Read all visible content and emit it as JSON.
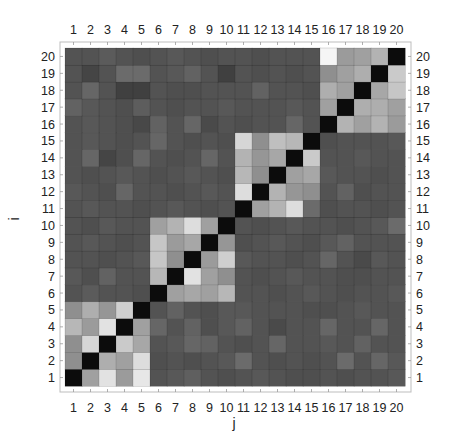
{
  "chart_data": {
    "type": "heatmap",
    "title": "",
    "xlabel": "j",
    "ylabel": "i",
    "x_ticks": [
      "1",
      "2",
      "3",
      "4",
      "5",
      "6",
      "7",
      "8",
      "9",
      "10",
      "11",
      "12",
      "13",
      "14",
      "15",
      "16",
      "17",
      "18",
      "19",
      "20"
    ],
    "y_ticks": [
      "1",
      "2",
      "3",
      "4",
      "5",
      "6",
      "7",
      "8",
      "9",
      "10",
      "11",
      "12",
      "13",
      "14",
      "15",
      "16",
      "17",
      "18",
      "19",
      "20"
    ],
    "colormap": "grayscale (0 = black, 1 = white)",
    "value_range": [
      0,
      1
    ],
    "grid": true,
    "legend": "none",
    "rows_order": "row index i = 1..20 (i = 1 at bottom)",
    "matrix": [
      [
        0.0,
        0.62,
        0.9,
        0.6,
        0.92,
        0.3,
        0.32,
        0.35,
        0.3,
        0.28,
        0.3,
        0.32,
        0.3,
        0.28,
        0.28,
        0.3,
        0.28,
        0.3,
        0.3,
        0.32
      ],
      [
        0.55,
        0.0,
        0.68,
        0.62,
        0.88,
        0.28,
        0.3,
        0.28,
        0.3,
        0.32,
        0.4,
        0.3,
        0.28,
        0.3,
        0.28,
        0.3,
        0.4,
        0.3,
        0.38,
        0.32
      ],
      [
        0.55,
        0.85,
        0.0,
        0.8,
        0.65,
        0.3,
        0.32,
        0.38,
        0.36,
        0.3,
        0.28,
        0.3,
        0.38,
        0.3,
        0.3,
        0.32,
        0.3,
        0.36,
        0.3,
        0.3
      ],
      [
        0.72,
        0.6,
        0.9,
        0.0,
        0.62,
        0.38,
        0.3,
        0.36,
        0.28,
        0.32,
        0.36,
        0.3,
        0.26,
        0.3,
        0.3,
        0.38,
        0.3,
        0.3,
        0.38,
        0.3
      ],
      [
        0.55,
        0.68,
        0.58,
        0.82,
        0.0,
        0.3,
        0.36,
        0.3,
        0.28,
        0.32,
        0.32,
        0.3,
        0.3,
        0.3,
        0.28,
        0.28,
        0.3,
        0.32,
        0.3,
        0.3
      ],
      [
        0.3,
        0.33,
        0.3,
        0.3,
        0.28,
        0.0,
        0.62,
        0.65,
        0.62,
        0.72,
        0.3,
        0.3,
        0.28,
        0.3,
        0.32,
        0.3,
        0.28,
        0.3,
        0.3,
        0.32
      ],
      [
        0.32,
        0.28,
        0.36,
        0.3,
        0.3,
        0.72,
        0.0,
        0.9,
        0.62,
        0.55,
        0.3,
        0.28,
        0.3,
        0.32,
        0.3,
        0.3,
        0.28,
        0.28,
        0.3,
        0.3
      ],
      [
        0.3,
        0.3,
        0.28,
        0.3,
        0.32,
        0.78,
        0.55,
        0.0,
        0.6,
        0.82,
        0.32,
        0.3,
        0.3,
        0.28,
        0.3,
        0.38,
        0.3,
        0.26,
        0.32,
        0.3
      ],
      [
        0.3,
        0.32,
        0.3,
        0.28,
        0.3,
        0.78,
        0.6,
        0.65,
        0.0,
        0.58,
        0.28,
        0.3,
        0.32,
        0.3,
        0.28,
        0.32,
        0.36,
        0.3,
        0.3,
        0.3
      ],
      [
        0.3,
        0.28,
        0.32,
        0.3,
        0.3,
        0.62,
        0.7,
        0.88,
        0.62,
        0.0,
        0.3,
        0.28,
        0.3,
        0.32,
        0.3,
        0.3,
        0.28,
        0.3,
        0.32,
        0.4
      ],
      [
        0.3,
        0.32,
        0.3,
        0.3,
        0.28,
        0.3,
        0.32,
        0.3,
        0.28,
        0.3,
        0.0,
        0.62,
        0.7,
        0.88,
        0.4,
        0.28,
        0.3,
        0.3,
        0.28,
        0.3
      ],
      [
        0.32,
        0.3,
        0.28,
        0.38,
        0.3,
        0.3,
        0.28,
        0.3,
        0.32,
        0.3,
        0.88,
        0.0,
        0.7,
        0.58,
        0.55,
        0.3,
        0.36,
        0.28,
        0.3,
        0.3
      ],
      [
        0.3,
        0.28,
        0.3,
        0.32,
        0.3,
        0.28,
        0.3,
        0.32,
        0.3,
        0.28,
        0.72,
        0.55,
        0.0,
        0.62,
        0.65,
        0.32,
        0.3,
        0.3,
        0.28,
        0.3
      ],
      [
        0.3,
        0.38,
        0.24,
        0.28,
        0.38,
        0.3,
        0.28,
        0.3,
        0.38,
        0.3,
        0.7,
        0.58,
        0.65,
        0.0,
        0.8,
        0.3,
        0.3,
        0.32,
        0.3,
        0.3
      ],
      [
        0.3,
        0.32,
        0.3,
        0.28,
        0.3,
        0.38,
        0.3,
        0.28,
        0.3,
        0.28,
        0.85,
        0.55,
        0.75,
        0.72,
        0.0,
        0.28,
        0.3,
        0.3,
        0.3,
        0.32
      ],
      [
        0.3,
        0.32,
        0.3,
        0.28,
        0.25,
        0.36,
        0.3,
        0.38,
        0.26,
        0.3,
        0.28,
        0.3,
        0.3,
        0.38,
        0.3,
        0.0,
        0.7,
        0.62,
        0.7,
        0.6
      ],
      [
        0.36,
        0.32,
        0.3,
        0.28,
        0.34,
        0.3,
        0.28,
        0.3,
        0.3,
        0.32,
        0.3,
        0.3,
        0.3,
        0.32,
        0.3,
        0.62,
        0.0,
        0.68,
        0.68,
        0.62
      ],
      [
        0.3,
        0.38,
        0.3,
        0.22,
        0.22,
        0.3,
        0.28,
        0.28,
        0.3,
        0.3,
        0.3,
        0.36,
        0.3,
        0.3,
        0.28,
        0.68,
        0.62,
        0.0,
        0.65,
        0.78
      ],
      [
        0.3,
        0.24,
        0.3,
        0.4,
        0.4,
        0.3,
        0.32,
        0.36,
        0.3,
        0.22,
        0.3,
        0.28,
        0.3,
        0.28,
        0.3,
        0.55,
        0.62,
        0.68,
        0.0,
        0.8
      ],
      [
        0.3,
        0.3,
        0.33,
        0.3,
        0.28,
        0.3,
        0.32,
        0.3,
        0.28,
        0.3,
        0.3,
        0.28,
        0.3,
        0.3,
        0.3,
        0.98,
        0.6,
        0.62,
        0.7,
        0.0
      ]
    ]
  }
}
